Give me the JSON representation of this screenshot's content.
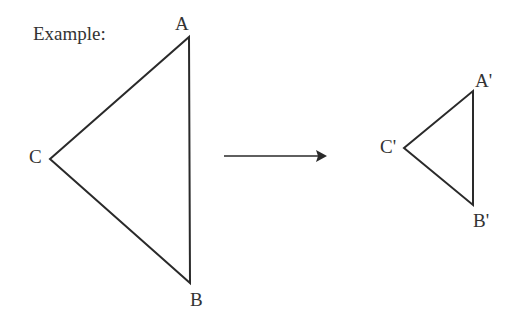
{
  "title": "Example:",
  "original": {
    "vertices": [
      {
        "label": "A",
        "x": 189,
        "y": 37
      },
      {
        "label": "B",
        "x": 190,
        "y": 283
      },
      {
        "label": "C",
        "x": 50,
        "y": 159
      }
    ]
  },
  "image": {
    "vertices": [
      {
        "label": "A'",
        "x": 473,
        "y": 91
      },
      {
        "label": "B'",
        "x": 473,
        "y": 205
      },
      {
        "label": "C'",
        "x": 404,
        "y": 148
      }
    ]
  },
  "arrow": {
    "x1": 224,
    "y1": 156,
    "x2": 326,
    "y2": 156
  },
  "colors": {
    "stroke": "#2a2a2a",
    "text": "#333333"
  }
}
